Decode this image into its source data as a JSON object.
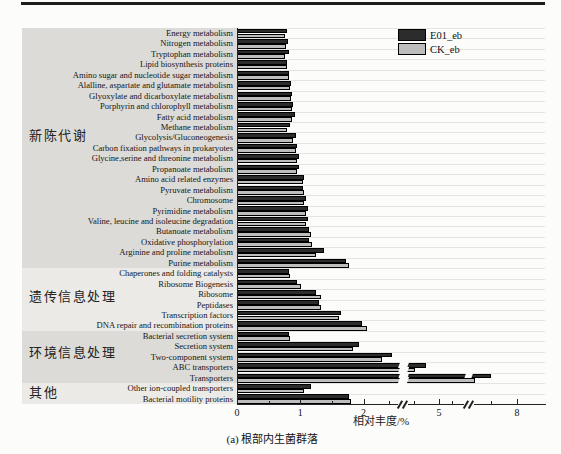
{
  "chart_data": {
    "type": "bar",
    "orientation": "horizontal",
    "title": "",
    "xlabel": "相对丰度/%",
    "ylabel": "",
    "caption": "(a) 根部内生菌群落",
    "legend_position": "top-right",
    "grid": true,
    "categories": [
      "Energy metabolism",
      "Nitrogen metabolism",
      "Tryptophan metabolism",
      "Lipid biosynthesis proteins",
      "Amino sugar and nucleotide sugar metabolism",
      "Alalline, aspartate and glutamate metabolism",
      "Glyoxylate and dicarboxylate metabolism",
      "Porphyrin and chlorophyll metabolism",
      "Fatty acid metabolism",
      "Methane metabolism",
      "Glycolysis/Gluconeogenesis",
      "Carbon fixation pathways in prokaryotes",
      "Glycine,serine and threonine metabolism",
      "Propanoate metabolism",
      "Amino acid related enzymes",
      "Pyruvate metabolism",
      "Chromosome",
      "Pyrimidine metabolism",
      "Valine, leucine and isoleucine degradation",
      "Butanoate metabolism",
      "Oxidative phosphorylation",
      "Arginine and proline metabolism",
      "Purine metabolism",
      "Chaperones and folding catalysts",
      "Ribosome Biogenesis",
      "Ribosome",
      "Peptidases",
      "Transcription factors",
      "DNA repair and recombination proteins",
      "Bacterial secretion system",
      "Secretion system",
      "Two-component system",
      "ABC transporters",
      "Transporters",
      "Other ion-coupled transporters",
      "Bacterial motility proteins"
    ],
    "series": [
      {
        "name": "E01_eb",
        "color": "#2c2c2c",
        "values": [
          0.77,
          0.79,
          0.8,
          0.77,
          0.81,
          0.84,
          0.85,
          0.87,
          0.9,
          0.82,
          0.91,
          0.94,
          0.97,
          0.96,
          1.05,
          1.03,
          1.08,
          1.1,
          1.11,
          1.13,
          1.12,
          1.36,
          1.71,
          0.8,
          0.94,
          1.24,
          1.28,
          1.63,
          1.96,
          0.81,
          1.92,
          3.1,
          4.45,
          6.95,
          1.15,
          1.75
        ]
      },
      {
        "name": "CK_eb",
        "color": "#bdbdbd",
        "values": [
          0.74,
          0.76,
          0.75,
          0.78,
          0.8,
          0.82,
          0.84,
          0.86,
          0.86,
          0.78,
          0.87,
          0.91,
          0.94,
          0.94,
          1.02,
          1.05,
          1.04,
          1.07,
          1.08,
          1.15,
          1.17,
          1.23,
          1.75,
          0.83,
          0.99,
          1.32,
          1.32,
          1.6,
          2.08,
          0.83,
          1.82,
          2.69,
          4.02,
          6.35,
          1.04,
          1.78
        ]
      }
    ],
    "category_groups": [
      {
        "label": "新陈代谢",
        "start": 0,
        "end": 22,
        "bg": "#dcdbd7"
      },
      {
        "label": "遗传信息处理",
        "start": 23,
        "end": 28,
        "bg": "#ebeae7"
      },
      {
        "label": "环境信息处理",
        "start": 29,
        "end": 33,
        "bg": "#dcdbd7"
      },
      {
        "label": "其他",
        "start": 34,
        "end": 35,
        "bg": "#ebeae7"
      }
    ],
    "x_axis": {
      "label": "相对丰度/%",
      "ticks": [
        0,
        1,
        2,
        5,
        8
      ],
      "minor_ticks": [
        0.5,
        1.5,
        3,
        4,
        5.5,
        7
      ],
      "breaks": [
        [
          3.4,
          3.75
        ],
        [
          6.0,
          6.28
        ]
      ],
      "note": "axis has scale breaks between 2-5 and 5-8"
    }
  }
}
